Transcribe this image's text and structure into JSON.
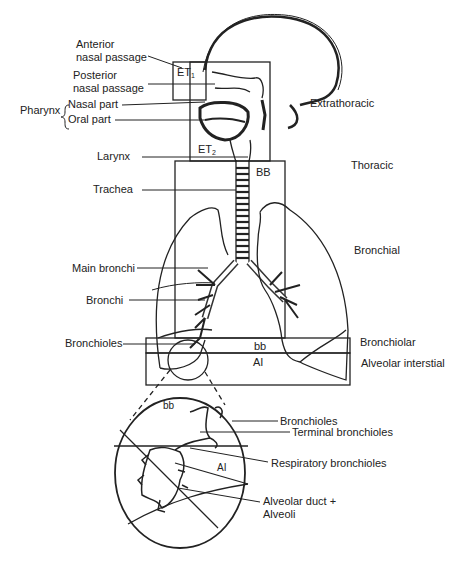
{
  "diagram": {
    "anatomy_labels": {
      "anterior_nasal_passage": [
        "Anterior",
        "nasal passage"
      ],
      "posterior_nasal_passage": [
        "Posterior",
        "nasal passage"
      ],
      "pharynx": "Pharynx",
      "pharynx_nasal_part": "Nasal part",
      "pharynx_oral_part": "Oral part",
      "larynx": "Larynx",
      "trachea": "Trachea",
      "main_bronchi": "Main bronchi",
      "bronchi": "Bronchi",
      "bronchioles": "Bronchioles"
    },
    "region_labels": {
      "extrathoracic": "Extrathoracic",
      "thoracic": "Thoracic",
      "bronchial": "Bronchial",
      "bronchiolar": "Bronchiolar",
      "alveolar_interstitial": "Alveolar interstial"
    },
    "box_codes": {
      "et1": "ET",
      "et1_sub": "1",
      "et2": "ET",
      "et2_sub": "2",
      "bb_upper": "BB",
      "bb_lower": "bb",
      "ai": "AI"
    },
    "inset": {
      "bb": "bb",
      "ai": "AI",
      "labels": {
        "bronchioles": "Bronchioles",
        "terminal_bronchioles": "Terminal bronchioles",
        "respiratory_bronchioles": "Respiratory bronchioles",
        "alveolar_duct": "Alveolar duct +",
        "alveoli": "Alveoli"
      }
    }
  }
}
